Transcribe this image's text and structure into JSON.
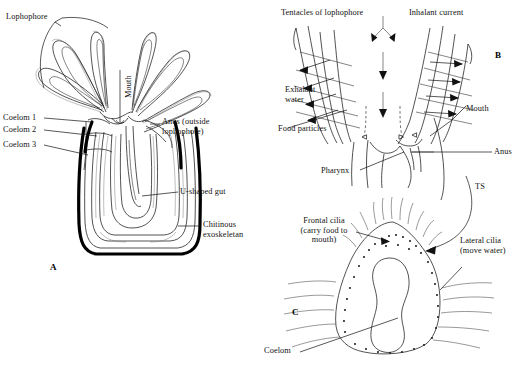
{
  "figure": {
    "type": "biological-diagram",
    "background_color": "#ffffff",
    "ink_color": "#111111"
  },
  "panels": [
    {
      "id": "A",
      "letter": "A",
      "caption": "Whole animal in longitudinal section showing lophophore, coeloms, U-shaped gut and chitinous exoskeleton"
    },
    {
      "id": "B",
      "letter": "B",
      "caption": "Detail of lophophore base showing water currents and food capture"
    },
    {
      "id": "C",
      "letter": "C",
      "caption": "Transverse section (TS) of a single tentacle showing frontal and lateral cilia"
    }
  ],
  "labels_a": [
    {
      "name": "lophophore",
      "text": "Lophophore"
    },
    {
      "name": "mouth",
      "text": "Mouth"
    },
    {
      "name": "coelom-1",
      "text": "Coelom 1"
    },
    {
      "name": "coelom-2",
      "text": "Coelom 2"
    },
    {
      "name": "coelom-3",
      "text": "Coelom 3"
    },
    {
      "name": "anus-outside-lophophore",
      "text": "Anus (outside\nlophophore)"
    },
    {
      "name": "u-shaped-gut",
      "text": "U-shaped gut"
    },
    {
      "name": "chitinous-exoskeletan",
      "text": "Chitinous\nexoskeletan"
    }
  ],
  "labels_b": [
    {
      "name": "tentacles-of-lophophore",
      "text": "Tentacles of lophophore"
    },
    {
      "name": "inhalant-current",
      "text": "Inhalant current"
    },
    {
      "name": "exhalant-water",
      "text": "Exhalant\nwater"
    },
    {
      "name": "food-particles",
      "text": "Food particles"
    },
    {
      "name": "pharynx",
      "text": "Pharynx"
    },
    {
      "name": "mouth",
      "text": "Mouth"
    },
    {
      "name": "anus",
      "text": "Anus"
    }
  ],
  "labels_c": [
    {
      "name": "ts-section-marker",
      "text": "TS"
    },
    {
      "name": "frontal-cilia",
      "text": "Frontal cilia\n(carry food to\nmouth)"
    },
    {
      "name": "lateral-cilia",
      "text": "Lateral cilia\n(move water)"
    },
    {
      "name": "coelom",
      "text": "Coelom"
    }
  ]
}
